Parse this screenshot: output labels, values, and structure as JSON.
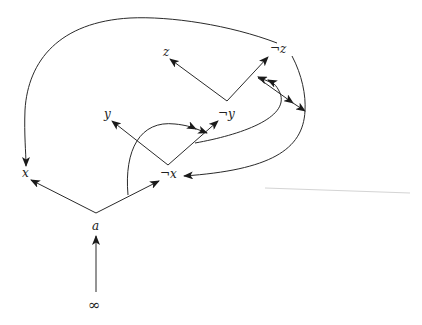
{
  "diagram": {
    "type": "directed-graph",
    "nodes": {
      "a": {
        "label": "a"
      },
      "infinity": {
        "label": "∞"
      },
      "x": {
        "label": "x"
      },
      "not_x": {
        "label": "¬x"
      },
      "y": {
        "label": "y"
      },
      "not_y": {
        "label": "¬y"
      },
      "z": {
        "label": "z"
      },
      "not_z": {
        "label": "¬z"
      }
    },
    "edges": [
      {
        "from": "∞",
        "to": "a"
      },
      {
        "from": "a",
        "to": "x"
      },
      {
        "from": "a",
        "to": "¬x"
      },
      {
        "from": "¬x",
        "to": "y"
      },
      {
        "from": "¬x",
        "to": "¬y"
      },
      {
        "from": "¬y",
        "to": "z"
      },
      {
        "from": "¬y",
        "to": "¬z"
      },
      {
        "from": "¬z",
        "to": "x",
        "style": "curved-loop-top"
      },
      {
        "from": "a→¬x edge",
        "to": "¬x→¬y edge",
        "style": "curved-double-arrow"
      },
      {
        "from": "¬x→¬y edge",
        "to": "¬y→¬z edge",
        "style": "curved-double-arrow"
      },
      {
        "from": "¬y→¬z edge",
        "to": "right-point",
        "style": "double-arrow"
      },
      {
        "from": "¬z",
        "to": "¬x",
        "style": "curved-right"
      }
    ]
  }
}
